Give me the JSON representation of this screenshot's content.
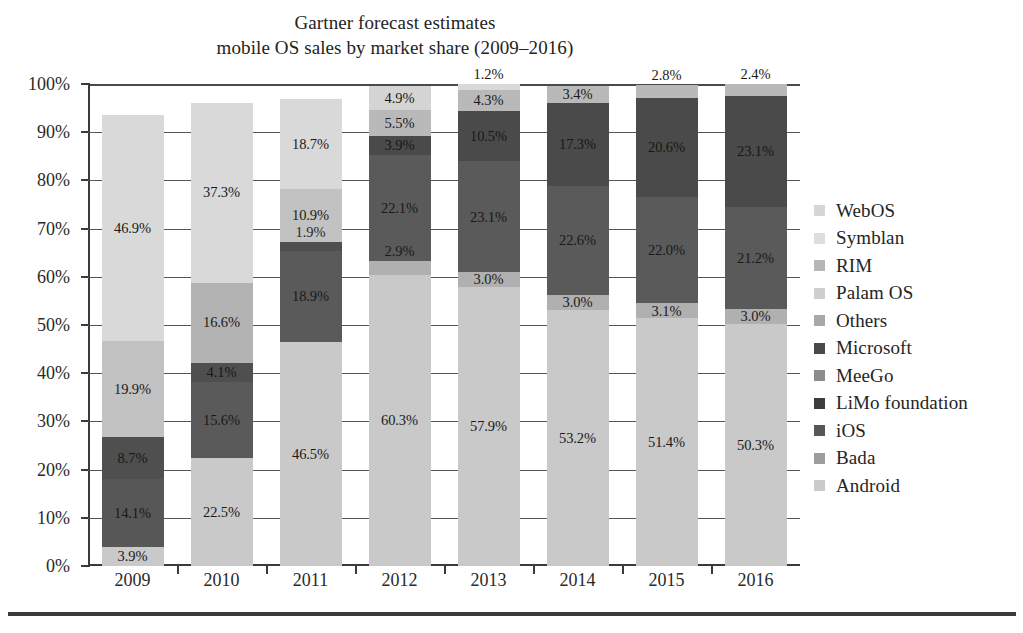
{
  "chart_data": {
    "type": "bar",
    "stacked": true,
    "stack_mode": "percent",
    "title": "Gartner forecast estimates",
    "subtitle": "mobile OS sales by market share (2009–2016)",
    "title_lines": [
      "Gartner forecast estimates",
      "mobile OS sales by market share (2009–2016)"
    ],
    "xlabel": "",
    "ylabel": "",
    "ylim": [
      0,
      100
    ],
    "ytick_labels": [
      "0%",
      "10%",
      "20%",
      "30%",
      "40%",
      "50%",
      "60%",
      "70%",
      "80%",
      "90%",
      "100%"
    ],
    "ytick_values": [
      0,
      10,
      20,
      30,
      40,
      50,
      60,
      70,
      80,
      90,
      100
    ],
    "grid": true,
    "legend_position": "right",
    "categories": [
      "2009",
      "2010",
      "2011",
      "2012",
      "2013",
      "2014",
      "2015",
      "2016"
    ],
    "legend_entries": [
      "WebOS",
      "Symblan",
      "RIM",
      "Palam OS",
      "Others",
      "Microsoft",
      "MeeGo",
      "LiMo foundation",
      "iOS",
      "Bada",
      "Android"
    ],
    "legend_colors": [
      "#d6d6d6",
      "#dedede",
      "#b6b6b6",
      "#cfcfcf",
      "#a9a9a9",
      "#4a4a4a",
      "#8c8c8c",
      "#3c3c3c",
      "#575757",
      "#9d9d9d",
      "#cacaca"
    ],
    "bars": [
      {
        "year": "2009",
        "segments": [
          {
            "label": "3.9%",
            "value": 3.9,
            "series": "Android",
            "color": "#c9c9c9",
            "label_color": "dark-text"
          },
          {
            "label": "14.1%",
            "value": 14.1,
            "series": "iOS",
            "color": "#575757",
            "label_color": "light-bg"
          },
          {
            "label": "8.7%",
            "value": 8.7,
            "series": "Microsoft",
            "color": "#4f4f4f",
            "label_color": "light-bg"
          },
          {
            "label": "19.9%",
            "value": 19.9,
            "series": "RIM",
            "color": "#c2c2c2",
            "label_color": "dark-text"
          },
          {
            "label": "46.9%",
            "value": 46.9,
            "series": "Symblan",
            "color": "#d9d9d9",
            "label_color": "dark-text"
          }
        ]
      },
      {
        "year": "2010",
        "segments": [
          {
            "label": "22.5%",
            "value": 22.5,
            "series": "Android",
            "color": "#c9c9c9",
            "label_color": "dark-text"
          },
          {
            "label": "15.6%",
            "value": 15.6,
            "series": "iOS",
            "color": "#5a5a5a",
            "label_color": "light-bg"
          },
          {
            "label": "4.1%",
            "value": 4.1,
            "series": "Microsoft",
            "color": "#4f4f4f",
            "label_color": "light-bg"
          },
          {
            "label": "16.6%",
            "value": 16.6,
            "series": "RIM",
            "color": "#b3b3b3",
            "label_color": "dark-text"
          },
          {
            "label": "37.3%",
            "value": 37.3,
            "series": "Symblan",
            "color": "#d9d9d9",
            "label_color": "dark-text"
          }
        ]
      },
      {
        "year": "2011",
        "segments": [
          {
            "label": "46.5%",
            "value": 46.5,
            "series": "Android",
            "color": "#c9c9c9",
            "label_color": "dark-text"
          },
          {
            "label": "18.9%",
            "value": 18.9,
            "series": "iOS",
            "color": "#5a5a5a",
            "label_color": "light-bg"
          },
          {
            "label": "1.9%",
            "value": 1.9,
            "series": "Microsoft",
            "color": "#4f4f4f",
            "label_color": "light-bg"
          },
          {
            "label": "10.9%",
            "value": 10.9,
            "series": "RIM",
            "color": "#c2c2c2",
            "label_color": "dark-text"
          },
          {
            "label": "18.7%",
            "value": 18.7,
            "series": "Symblan",
            "color": "#d9d9d9",
            "label_color": "dark-text"
          }
        ]
      },
      {
        "year": "2012",
        "segments": [
          {
            "label": "60.3%",
            "value": 60.3,
            "series": "Android",
            "color": "#c9c9c9",
            "label_color": "dark-text"
          },
          {
            "label": "2.9%",
            "value": 2.9,
            "series": "Bada",
            "color": "#b0b0b0",
            "label_color": "dark-text"
          },
          {
            "label": "22.1%",
            "value": 22.1,
            "series": "iOS",
            "color": "#5a5a5a",
            "label_color": "light-bg"
          },
          {
            "label": "3.9%",
            "value": 3.9,
            "series": "Microsoft",
            "color": "#4a4a4a",
            "label_color": "light-bg"
          },
          {
            "label": "5.5%",
            "value": 5.5,
            "series": "RIM",
            "color": "#b9b9b9",
            "label_color": "dark-text"
          },
          {
            "label": "4.9%",
            "value": 4.9,
            "series": "Symblan",
            "color": "#d4d4d4",
            "label_color": "dark-text"
          }
        ]
      },
      {
        "year": "2013",
        "segments": [
          {
            "label": "57.9%",
            "value": 57.9,
            "series": "Android",
            "color": "#c9c9c9",
            "label_color": "dark-text"
          },
          {
            "label": "3.0%",
            "value": 3.0,
            "series": "Bada",
            "color": "#b0b0b0",
            "label_color": "dark-text"
          },
          {
            "label": "23.1%",
            "value": 23.1,
            "series": "iOS",
            "color": "#5a5a5a",
            "label_color": "light-bg"
          },
          {
            "label": "10.5%",
            "value": 10.5,
            "series": "Microsoft",
            "color": "#4a4a4a",
            "label_color": "light-bg"
          },
          {
            "label": "4.3%",
            "value": 4.3,
            "series": "RIM",
            "color": "#b9b9b9",
            "label_color": "dark-text"
          },
          {
            "label": "1.2%",
            "value": 1.2,
            "series": "Symblan",
            "color": "#d9d9d9",
            "label_color": "dark-text"
          }
        ]
      },
      {
        "year": "2014",
        "segments": [
          {
            "label": "53.2%",
            "value": 53.2,
            "series": "Android",
            "color": "#c9c9c9",
            "label_color": "dark-text"
          },
          {
            "label": "3.0%",
            "value": 3.0,
            "series": "Bada",
            "color": "#b0b0b0",
            "label_color": "dark-text"
          },
          {
            "label": "22.6%",
            "value": 22.6,
            "series": "iOS",
            "color": "#5a5a5a",
            "label_color": "light-bg"
          },
          {
            "label": "17.3%",
            "value": 17.3,
            "series": "Microsoft",
            "color": "#4a4a4a",
            "label_color": "light-bg"
          },
          {
            "label": "3.4%",
            "value": 3.4,
            "series": "RIM",
            "color": "#b9b9b9",
            "label_color": "dark-text"
          }
        ]
      },
      {
        "year": "2015",
        "segments": [
          {
            "label": "51.4%",
            "value": 51.4,
            "series": "Android",
            "color": "#c9c9c9",
            "label_color": "dark-text"
          },
          {
            "label": "3.1%",
            "value": 3.1,
            "series": "Bada",
            "color": "#b0b0b0",
            "label_color": "dark-text"
          },
          {
            "label": "22.0%",
            "value": 22.0,
            "series": "iOS",
            "color": "#5a5a5a",
            "label_color": "light-bg"
          },
          {
            "label": "20.6%",
            "value": 20.6,
            "series": "Microsoft",
            "color": "#4a4a4a",
            "label_color": "light-bg"
          },
          {
            "label": "2.8%",
            "value": 2.8,
            "series": "RIM",
            "color": "#b9b9b9",
            "label_color": "dark-text"
          }
        ]
      },
      {
        "year": "2016",
        "segments": [
          {
            "label": "50.3%",
            "value": 50.3,
            "series": "Android",
            "color": "#c9c9c9",
            "label_color": "dark-text"
          },
          {
            "label": "3.0%",
            "value": 3.0,
            "series": "Bada",
            "color": "#b0b0b0",
            "label_color": "dark-text"
          },
          {
            "label": "21.2%",
            "value": 21.2,
            "series": "iOS",
            "color": "#5a5a5a",
            "label_color": "light-bg"
          },
          {
            "label": "23.1%",
            "value": 23.1,
            "series": "Microsoft",
            "color": "#4a4a4a",
            "label_color": "light-bg"
          },
          {
            "label": "2.4%",
            "value": 2.4,
            "series": "RIM",
            "color": "#b9b9b9",
            "label_color": "dark-text"
          }
        ]
      }
    ]
  }
}
